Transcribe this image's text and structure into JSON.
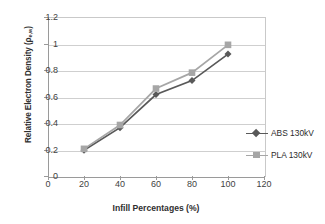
{
  "chart_data": {
    "type": "line",
    "title": "",
    "xlabel": "Infill Percentages (%)",
    "ylabel": "Relative Electron Density (ρ",
    "ylabel_subscript": "e,w",
    "ylabel_suffix": ")",
    "x": [
      20,
      40,
      60,
      80,
      100
    ],
    "xlim": [
      0,
      120
    ],
    "ylim": [
      0,
      1.2
    ],
    "xticks": [
      "0",
      "20",
      "40",
      "60",
      "80",
      "100",
      "120"
    ],
    "xtick_values": [
      0,
      20,
      40,
      60,
      80,
      100,
      120
    ],
    "yticks": [
      "0",
      "0.2",
      "0.4",
      "0.6",
      "0.8",
      "1",
      "1.2"
    ],
    "ytick_values": [
      0,
      0.2,
      0.4,
      0.6,
      0.8,
      1.0,
      1.2
    ],
    "grid": "horizontal",
    "legend_position": "right",
    "series": [
      {
        "name": "ABS 130kV",
        "values": [
          0.195,
          0.365,
          0.615,
          0.72,
          0.92
        ],
        "color": "#595959",
        "marker": "diamond"
      },
      {
        "name": "PLA 130kV",
        "values": [
          0.205,
          0.385,
          0.66,
          0.78,
          0.99
        ],
        "color": "#a6a6a6",
        "marker": "square"
      }
    ]
  },
  "legend": {
    "entries": [
      {
        "label": "ABS 130kV"
      },
      {
        "label": "PLA 130kV"
      }
    ]
  }
}
